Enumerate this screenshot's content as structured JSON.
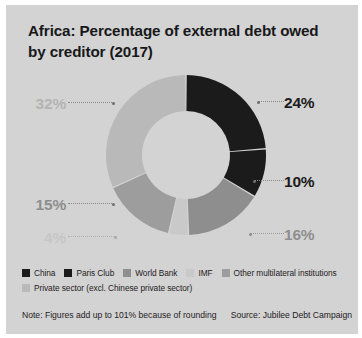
{
  "card": {
    "background": "#d3d3d3"
  },
  "title": "Africa: Percentage of external debt owed by creditor (2017)",
  "footer": {
    "note": "Note: Figures add up to 101% because of rounding",
    "source": "Source: Jubilee Debt Campaign"
  },
  "legend": {
    "rows": [
      [
        {
          "label": "China",
          "color": "#1b1b1b"
        },
        {
          "label": "Paris Club",
          "color": "#1b1b1b"
        },
        {
          "label": "World Bank",
          "color": "#8e8e8e"
        },
        {
          "label": "IMF",
          "color": "#c9c9c9"
        },
        {
          "label": "Other multilateral institutions",
          "color": "#9d9d9d"
        }
      ],
      [
        {
          "label": "Private sector (excl. Chinese private sector)",
          "color": "#b9b9b9"
        }
      ]
    ]
  },
  "labels": {
    "private": "32%",
    "other": "15%",
    "imf": "4%",
    "china": "24%",
    "paris": "10%",
    "world_bank": "16%"
  },
  "chart_data": {
    "type": "pie",
    "variant": "donut",
    "title": "Africa: Percentage of external debt owed by creditor (2017)",
    "unit": "percent",
    "total": 101,
    "start_angle": 0,
    "direction": "clockwise",
    "inner_radius_ratio": 0.55,
    "legend_position": "bottom",
    "categories": [
      "China",
      "Paris Club",
      "World Bank",
      "IMF",
      "Other multilateral institutions",
      "Private sector (excl. Chinese private sector)"
    ],
    "values": [
      24,
      10,
      16,
      4,
      15,
      32
    ],
    "colors": [
      "#1b1b1b",
      "#1b1b1b",
      "#8e8e8e",
      "#c9c9c9",
      "#9d9d9d",
      "#b9b9b9"
    ],
    "labels": [
      "24%",
      "10%",
      "16%",
      "4%",
      "15%",
      "32%"
    ],
    "slices": [
      {
        "name": "China",
        "value": 24,
        "label": "24%",
        "color": "#1b1b1b",
        "label_side": "right"
      },
      {
        "name": "Paris Club",
        "value": 10,
        "label": "10%",
        "color": "#1b1b1b",
        "label_side": "right"
      },
      {
        "name": "World Bank",
        "value": 16,
        "label": "16%",
        "color": "#8e8e8e",
        "label_side": "right"
      },
      {
        "name": "IMF",
        "value": 4,
        "label": "4%",
        "color": "#c9c9c9",
        "label_side": "left"
      },
      {
        "name": "Other multilateral institutions",
        "value": 15,
        "label": "15%",
        "color": "#9d9d9d",
        "label_side": "left"
      },
      {
        "name": "Private sector (excl. Chinese private sector)",
        "value": 32,
        "label": "32%",
        "color": "#b9b9b9",
        "label_side": "left"
      }
    ],
    "note": "Note: Figures add up to 101% because of rounding",
    "source": "Source: Jubilee Debt Campaign"
  }
}
